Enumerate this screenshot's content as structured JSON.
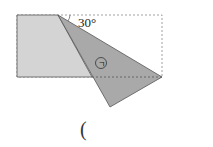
{
  "figure": {
    "angle_label": "30°",
    "marker_label": "ㄱ",
    "answer_blank": "(",
    "colors": {
      "rectangle_fill": "#d4d4d4",
      "triangle_fill": "#a9a9a9",
      "stroke": "#555555",
      "dashed": "#888888"
    }
  }
}
